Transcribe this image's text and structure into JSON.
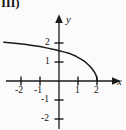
{
  "figure": {
    "panel_label": "III)",
    "background_color": "#fbfbfb",
    "stroke_color": "#1a1a1a"
  },
  "chart_data": {
    "type": "line",
    "title": "",
    "xlabel": "x",
    "ylabel": "y",
    "xlim": [
      -2.9,
      3.1
    ],
    "ylim": [
      -2.6,
      2.5
    ],
    "grid": false,
    "legend": null,
    "axis_arrows": {
      "x": "right",
      "y": "up"
    },
    "x_ticks": [
      -2,
      -1,
      1,
      2
    ],
    "x_tick_labels": [
      "-2",
      "-1",
      "1",
      "2"
    ],
    "y_ticks": [
      -2,
      -1,
      1,
      2
    ],
    "y_tick_labels": [
      "-2",
      "-1",
      "1",
      "2"
    ],
    "series": [
      {
        "name": "curve",
        "description": "decreasing concave curve from upper-left, y-intercept near 1.6, meets x-axis at x = 2",
        "x": [
          -2.9,
          -2.6,
          -2.2,
          -1.8,
          -1.4,
          -1.0,
          -0.6,
          -0.2,
          0.0,
          0.3,
          0.6,
          0.9,
          1.2,
          1.4,
          1.6,
          1.75,
          1.85,
          1.93,
          1.98,
          2.0
        ],
        "y": [
          2.04,
          2.01,
          1.97,
          1.93,
          1.87,
          1.81,
          1.73,
          1.64,
          1.59,
          1.52,
          1.43,
          1.3,
          1.13,
          0.99,
          0.8,
          0.63,
          0.49,
          0.35,
          0.2,
          0.0
        ]
      }
    ],
    "x_intercepts": [
      2
    ],
    "y_intercept": 1.59
  },
  "geometry": {
    "origin_px": {
      "x": 59,
      "y": 81
    },
    "unit_px": 19
  }
}
